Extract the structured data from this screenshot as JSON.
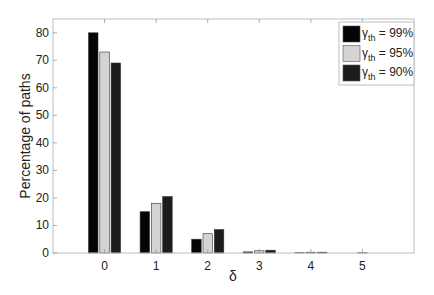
{
  "chart_data": {
    "type": "bar",
    "title": "",
    "xlabel": "δ",
    "ylabel": "Percentage of paths",
    "categories": [
      "0",
      "1",
      "2",
      "3",
      "4",
      "5"
    ],
    "series": [
      {
        "name": "γth = 99%",
        "label_main": "γ",
        "label_sub": "th",
        "label_rest": " = 99%",
        "color": "#050505",
        "values": [
          80,
          15,
          5,
          0.4,
          0.1,
          0
        ]
      },
      {
        "name": "γth = 95%",
        "label_main": "γ",
        "label_sub": "th",
        "label_rest": " = 95%",
        "color": "#d4d4d4",
        "values": [
          73,
          18,
          7,
          0.8,
          0.3,
          0.1
        ]
      },
      {
        "name": "γth = 90%",
        "label_main": "γ",
        "label_sub": "th",
        "label_rest": " = 90%",
        "color": "#1c1c1c",
        "values": [
          69,
          20.5,
          8.5,
          1.0,
          0.3,
          0
        ]
      }
    ],
    "xlim": [
      -1,
      6
    ],
    "ylim": [
      0,
      85
    ],
    "yticks": [
      0,
      10,
      20,
      30,
      40,
      50,
      60,
      70,
      80
    ],
    "xticks": [
      0,
      1,
      2,
      3,
      4,
      5
    ],
    "grid": false,
    "legend_position": "upper right"
  }
}
